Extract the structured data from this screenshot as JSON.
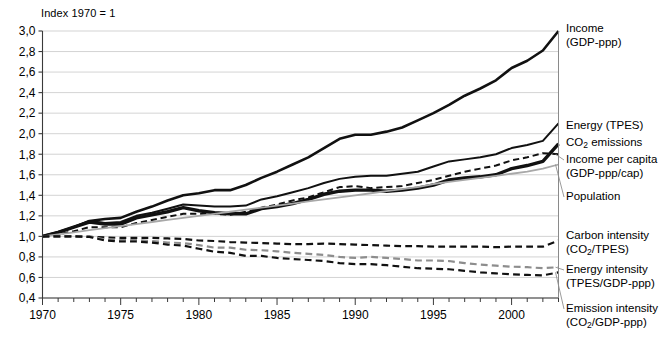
{
  "figure": {
    "axis_note": "Index 1970 = 1",
    "decimal_separator": ",",
    "grid_color": "#c8c8c8",
    "axis_color": "#3a3a3a"
  },
  "chart_data": {
    "type": "line",
    "title": "",
    "subtitle": "",
    "xlabel": "",
    "ylabel": "",
    "annotations": [
      "Index 1970 = 1"
    ],
    "grid": "horizontal",
    "legend_position": "right-inline",
    "xlim": [
      1970,
      2003
    ],
    "ylim": [
      0.4,
      3.0
    ],
    "ytick_step": 0.2,
    "yticks": [
      "3,0",
      "2,8",
      "2,6",
      "2,4",
      "2,2",
      "2,0",
      "1,8",
      "1,6",
      "1,4",
      "1,2",
      "1,0",
      "0,8",
      "0,6",
      "0,4"
    ],
    "ytick_values": [
      3.0,
      2.8,
      2.6,
      2.4,
      2.2,
      2.0,
      1.8,
      1.6,
      1.4,
      1.2,
      1.0,
      0.8,
      0.6,
      0.4
    ],
    "xticks": [
      "1970",
      "1975",
      "1980",
      "1985",
      "1990",
      "1995",
      "2000"
    ],
    "xtick_values": [
      1970,
      1975,
      1980,
      1985,
      1990,
      1995,
      2000
    ],
    "minor_xtick_every": 1,
    "x": [
      1970,
      1971,
      1972,
      1973,
      1974,
      1975,
      1976,
      1977,
      1978,
      1979,
      1980,
      1981,
      1982,
      1983,
      1984,
      1985,
      1986,
      1987,
      1988,
      1989,
      1990,
      1991,
      1992,
      1993,
      1994,
      1995,
      1996,
      1997,
      1998,
      1999,
      2000,
      2001,
      2002,
      2003
    ],
    "series": [
      {
        "name": "Income (GDP-ppp)",
        "label_line1": "Income",
        "label_line2": "(GDP-ppp)",
        "color": "#111111",
        "width": 2.6,
        "dash": "none",
        "end_value": 3.0,
        "values": [
          1.0,
          1.04,
          1.09,
          1.15,
          1.17,
          1.18,
          1.24,
          1.29,
          1.35,
          1.4,
          1.42,
          1.45,
          1.45,
          1.5,
          1.57,
          1.63,
          1.7,
          1.77,
          1.86,
          1.95,
          1.99,
          1.99,
          2.02,
          2.06,
          2.13,
          2.2,
          2.28,
          2.37,
          2.44,
          2.52,
          2.64,
          2.71,
          2.81,
          3.0
        ]
      },
      {
        "name": "Energy (TPES)",
        "label_line1": "Energy (TPES)",
        "label_line2": "",
        "color": "#111111",
        "width": 2.0,
        "dash": "none",
        "end_value": 2.1,
        "values": [
          1.0,
          1.04,
          1.09,
          1.15,
          1.13,
          1.14,
          1.2,
          1.23,
          1.27,
          1.31,
          1.3,
          1.29,
          1.29,
          1.3,
          1.36,
          1.39,
          1.43,
          1.47,
          1.52,
          1.56,
          1.58,
          1.59,
          1.59,
          1.61,
          1.63,
          1.68,
          1.73,
          1.75,
          1.77,
          1.8,
          1.86,
          1.89,
          1.93,
          2.1
        ]
      },
      {
        "name": "CO2 emissions",
        "label_line1": "CO₂ emissions",
        "label_line2": "",
        "color": "#111111",
        "width": 3.4,
        "dash": "none",
        "end_value": 1.9,
        "values": [
          1.0,
          1.04,
          1.09,
          1.14,
          1.12,
          1.12,
          1.18,
          1.21,
          1.24,
          1.28,
          1.25,
          1.23,
          1.22,
          1.22,
          1.27,
          1.29,
          1.32,
          1.36,
          1.41,
          1.44,
          1.45,
          1.45,
          1.44,
          1.45,
          1.47,
          1.5,
          1.55,
          1.57,
          1.58,
          1.6,
          1.66,
          1.69,
          1.73,
          1.9
        ]
      },
      {
        "name": "Income per capita (GDP-ppp/cap)",
        "label_line1": "Income per capita",
        "label_line2": "(GDP-ppp/cap)",
        "color": "#111111",
        "width": 2.0,
        "dash": "dashed",
        "end_value": 1.8,
        "values": [
          1.0,
          1.02,
          1.05,
          1.09,
          1.09,
          1.09,
          1.13,
          1.16,
          1.19,
          1.22,
          1.22,
          1.22,
          1.21,
          1.24,
          1.28,
          1.31,
          1.35,
          1.38,
          1.43,
          1.48,
          1.49,
          1.47,
          1.48,
          1.49,
          1.52,
          1.55,
          1.59,
          1.63,
          1.66,
          1.69,
          1.74,
          1.77,
          1.81,
          1.8
        ]
      },
      {
        "name": "Population",
        "label_line1": "Population",
        "label_line2": "",
        "color": "#a8a8a8",
        "width": 1.8,
        "dash": "none",
        "end_value": 1.7,
        "values": [
          1.0,
          1.02,
          1.04,
          1.06,
          1.08,
          1.1,
          1.12,
          1.14,
          1.16,
          1.18,
          1.2,
          1.22,
          1.24,
          1.26,
          1.28,
          1.3,
          1.32,
          1.34,
          1.36,
          1.38,
          1.4,
          1.42,
          1.44,
          1.46,
          1.48,
          1.51,
          1.53,
          1.55,
          1.57,
          1.59,
          1.61,
          1.63,
          1.66,
          1.7
        ]
      },
      {
        "name": "Carbon intensity (CO2/TPES)",
        "label_line1": "Carbon intensity",
        "label_line2": "(CO₂/TPES)",
        "color": "#111111",
        "width": 2.2,
        "dash": "dashed",
        "end_value": 0.96,
        "values": [
          1.0,
          1.0,
          1.0,
          0.995,
          0.99,
          0.985,
          0.985,
          0.985,
          0.98,
          0.975,
          0.96,
          0.955,
          0.945,
          0.94,
          0.935,
          0.93,
          0.925,
          0.925,
          0.93,
          0.925,
          0.92,
          0.915,
          0.91,
          0.905,
          0.905,
          0.9,
          0.9,
          0.9,
          0.9,
          0.895,
          0.9,
          0.9,
          0.9,
          0.96
        ]
      },
      {
        "name": "Energy intensity (TPES/GDP-ppp)",
        "label_line1": "Energy intensity",
        "label_line2": "(TPES/GDP-ppp)",
        "color": "#8d8d8d",
        "width": 2.2,
        "dash": "dashed",
        "end_value": 0.7,
        "values": [
          1.0,
          1.0,
          1.0,
          1.0,
          0.97,
          0.965,
          0.965,
          0.955,
          0.94,
          0.935,
          0.915,
          0.89,
          0.89,
          0.87,
          0.865,
          0.855,
          0.84,
          0.83,
          0.82,
          0.8,
          0.79,
          0.8,
          0.79,
          0.78,
          0.765,
          0.765,
          0.76,
          0.74,
          0.725,
          0.715,
          0.705,
          0.7,
          0.69,
          0.7
        ]
      },
      {
        "name": "Emission intensity (CO2/GDP-ppp)",
        "label_line1": "Emission intensity",
        "label_line2": "(CO₂/GDP-ppp)",
        "color": "#111111",
        "width": 2.2,
        "dash": "dashed",
        "end_value": 0.65,
        "values": [
          1.0,
          1.0,
          1.0,
          0.995,
          0.96,
          0.95,
          0.95,
          0.94,
          0.92,
          0.91,
          0.88,
          0.85,
          0.84,
          0.81,
          0.81,
          0.79,
          0.78,
          0.77,
          0.76,
          0.74,
          0.73,
          0.73,
          0.72,
          0.705,
          0.69,
          0.685,
          0.68,
          0.665,
          0.65,
          0.64,
          0.63,
          0.625,
          0.62,
          0.65
        ]
      }
    ]
  },
  "series_labels": [
    {
      "key": "income",
      "line1": "Income",
      "line2": "(GDP-ppp)",
      "top": 22,
      "leader": false
    },
    {
      "key": "energy-tpes",
      "line1": "Energy (TPES)",
      "line2": "",
      "top": 119,
      "leader": false
    },
    {
      "key": "co2-emissions",
      "line1": "CO₂ emissions",
      "line2": "",
      "top": 136,
      "leader": false
    },
    {
      "key": "income-per-capita",
      "line1": "Income per capita",
      "line2": "(GDP-ppp/cap)",
      "top": 153,
      "leader": true
    },
    {
      "key": "population",
      "line1": "Population",
      "line2": "",
      "top": 190,
      "leader": true
    },
    {
      "key": "carbon-intensity",
      "line1": "Carbon intensity",
      "line2": "(CO₂/TPES)",
      "top": 229,
      "leader": false
    },
    {
      "key": "energy-intensity",
      "line1": "Energy intensity",
      "line2": "(TPES/GDP-ppp)",
      "top": 263,
      "leader": true
    },
    {
      "key": "emission-intensity",
      "line1": "Emission intensity",
      "line2": "(CO₂/GDP-ppp)",
      "top": 302,
      "leader": true
    }
  ]
}
